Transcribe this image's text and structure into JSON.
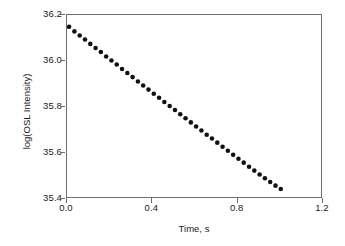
{
  "chart_data": {
    "type": "scatter",
    "title": "",
    "xlabel": "Time, s",
    "ylabel": "log(OSL Intensity)",
    "xlim": [
      0.0,
      1.2
    ],
    "ylim": [
      35.4,
      36.2
    ],
    "xticks": [
      "0.0",
      "0.4",
      "0.8",
      "1.2"
    ],
    "xtick_values": [
      0.0,
      0.4,
      0.8,
      1.2
    ],
    "yticks": [
      "36.2",
      "36.0",
      "35.8",
      "35.6",
      "35.4"
    ],
    "ytick_values": [
      36.2,
      36.0,
      35.8,
      35.6,
      35.4
    ],
    "grid": false,
    "legend": "none",
    "marker": "filled-circle",
    "marker_color": "#111111",
    "marker_size_px": 4.6,
    "axis_color": "#6e6e6e",
    "background_color": "#ffffff",
    "series": [
      {
        "name": "OSL decay",
        "x": [
          0.01,
          0.035,
          0.06,
          0.085,
          0.11,
          0.135,
          0.16,
          0.185,
          0.21,
          0.235,
          0.26,
          0.285,
          0.31,
          0.335,
          0.36,
          0.385,
          0.41,
          0.435,
          0.46,
          0.485,
          0.51,
          0.535,
          0.56,
          0.585,
          0.61,
          0.635,
          0.66,
          0.685,
          0.71,
          0.735,
          0.76,
          0.785,
          0.81,
          0.835,
          0.86,
          0.885,
          0.91,
          0.935,
          0.96,
          0.985,
          1.01
        ],
        "y": [
          36.148,
          36.128,
          36.11,
          36.092,
          36.073,
          36.055,
          36.037,
          36.018,
          36.0,
          35.982,
          35.963,
          35.945,
          35.927,
          35.908,
          35.89,
          35.872,
          35.854,
          35.836,
          35.818,
          35.8,
          35.782,
          35.764,
          35.746,
          35.728,
          35.71,
          35.692,
          35.674,
          35.657,
          35.639,
          35.621,
          35.603,
          35.586,
          35.568,
          35.551,
          35.533,
          35.516,
          35.499,
          35.482,
          35.466,
          35.45,
          35.435
        ]
      }
    ]
  }
}
